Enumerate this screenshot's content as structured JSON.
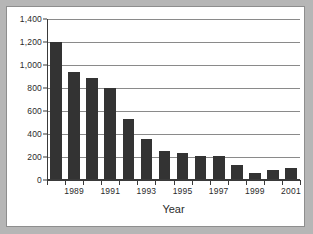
{
  "chart_data": {
    "type": "bar",
    "title": "",
    "xlabel": "Year",
    "ylabel": "",
    "categories": [
      "1988",
      "1989",
      "1990",
      "1991",
      "1992",
      "1993",
      "1994",
      "1995",
      "1996",
      "1997",
      "1998",
      "1999",
      "2000",
      "2001"
    ],
    "values": [
      1200,
      940,
      880,
      800,
      525,
      350,
      245,
      230,
      205,
      200,
      120,
      50,
      80,
      95
    ],
    "ylim": [
      0,
      1400
    ],
    "ytick_values": [
      0,
      200,
      400,
      600,
      800,
      1000,
      1200,
      1400
    ],
    "ytick_labels": [
      "0",
      "200",
      "400",
      "600",
      "800",
      "1,000",
      "1,200",
      "1,400"
    ],
    "xtick_labels": [
      "1989",
      "1991",
      "1993",
      "1995",
      "1997",
      "1999",
      "2001"
    ],
    "xtick_label_indices": [
      1,
      3,
      5,
      7,
      9,
      11,
      13
    ],
    "grid": true,
    "legend": "none",
    "bar_color": "#333333",
    "grid_color": "#8a8a8a",
    "axis_color": "#3a3a3a",
    "background_color": "#ffffff",
    "page_background_color": "#b6b6b6"
  }
}
